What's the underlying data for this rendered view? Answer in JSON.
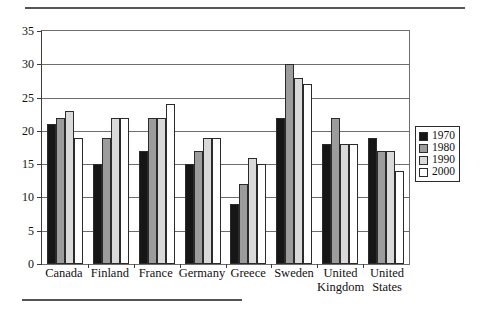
{
  "chart_data": {
    "type": "bar",
    "title": "",
    "subtitle": "",
    "xlabel": "",
    "ylabel": "",
    "ylim": [
      0,
      35
    ],
    "yticks": [
      0,
      5,
      10,
      15,
      20,
      25,
      30,
      35
    ],
    "grid": true,
    "legend_position": "right",
    "categories": [
      "Canada",
      "Finland",
      "France",
      "Germany",
      "Greece",
      "Sweden",
      "United Kingdom",
      "United States"
    ],
    "category_lines": [
      [
        "Canada"
      ],
      [
        "Finland"
      ],
      [
        "France"
      ],
      [
        "Germany"
      ],
      [
        "Greece"
      ],
      [
        "Sweden"
      ],
      [
        "United",
        "Kingdom"
      ],
      [
        "United",
        "States"
      ]
    ],
    "series": [
      {
        "name": "1970",
        "color": "#161616",
        "values": [
          21,
          15,
          17,
          15,
          9,
          22,
          18,
          19
        ]
      },
      {
        "name": "1980",
        "color": "#9c9c9c",
        "values": [
          22,
          19,
          22,
          17,
          12,
          30,
          22,
          17
        ]
      },
      {
        "name": "1990",
        "color": "#d9d9d9",
        "values": [
          23,
          22,
          22,
          19,
          16,
          28,
          18,
          17
        ]
      },
      {
        "name": "2000",
        "color": "#ffffff",
        "values": [
          19,
          22,
          24,
          19,
          15,
          27,
          18,
          14
        ]
      }
    ]
  },
  "legend": {
    "items": [
      {
        "label": "1970",
        "color": "#161616"
      },
      {
        "label": "1980",
        "color": "#9c9c9c"
      },
      {
        "label": "1990",
        "color": "#d9d9d9"
      },
      {
        "label": "2000",
        "color": "#ffffff"
      }
    ]
  },
  "colors": {
    "axis": "#3c3c3c",
    "gridline": "#6d6d6d",
    "bar_outline": "#2b2b2b",
    "rule": "#555555",
    "background": "#ffffff"
  }
}
